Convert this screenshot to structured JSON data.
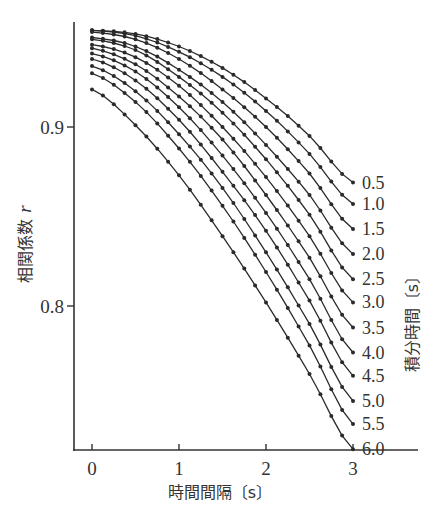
{
  "chart_data": {
    "type": "line",
    "title": "",
    "xlabel": "時間間隔〔s〕",
    "ylabel": "相関係数",
    "ylabel_symbol": "r",
    "legend_title": "積分時間〔s〕",
    "xlim": [
      -0.2,
      3.75
    ],
    "ylim": [
      0.72,
      0.959
    ],
    "x_ticks": [
      0,
      1,
      2,
      3
    ],
    "x_tick_labels": [
      "0",
      "1",
      "2",
      "3"
    ],
    "y_ticks": [
      0.8,
      0.9
    ],
    "y_tick_labels": [
      "0.8",
      "0.9"
    ],
    "grid": false,
    "legend_position": "right, labels at line ends",
    "markers": "small filled dots",
    "x": [
      0,
      0.5,
      1.0,
      1.5,
      2.0,
      2.5,
      3.0
    ],
    "series": [
      {
        "name": "0.5",
        "values": [
          0.954,
          0.952,
          0.945,
          0.933,
          0.916,
          0.895,
          0.869
        ]
      },
      {
        "name": "1.0",
        "values": [
          0.954,
          0.951,
          0.942,
          0.928,
          0.909,
          0.885,
          0.857
        ]
      },
      {
        "name": "1.5",
        "values": [
          0.953,
          0.949,
          0.938,
          0.921,
          0.9,
          0.874,
          0.843
        ]
      },
      {
        "name": "2.0",
        "values": [
          0.95,
          0.945,
          0.932,
          0.914,
          0.89,
          0.862,
          0.829
        ]
      },
      {
        "name": "2.5",
        "values": [
          0.949,
          0.943,
          0.928,
          0.908,
          0.882,
          0.851,
          0.815
        ]
      },
      {
        "name": "3.0",
        "values": [
          0.946,
          0.939,
          0.923,
          0.9,
          0.872,
          0.839,
          0.802
        ]
      },
      {
        "name": "3.5",
        "values": [
          0.944,
          0.935,
          0.917,
          0.893,
          0.862,
          0.827,
          0.788
        ]
      },
      {
        "name": "4.0",
        "values": [
          0.941,
          0.931,
          0.911,
          0.884,
          0.852,
          0.815,
          0.774
        ]
      },
      {
        "name": "4.5",
        "values": [
          0.938,
          0.926,
          0.904,
          0.875,
          0.842,
          0.803,
          0.761
        ]
      },
      {
        "name": "5.0",
        "values": [
          0.934,
          0.92,
          0.896,
          0.866,
          0.83,
          0.79,
          0.747
        ]
      },
      {
        "name": "5.5",
        "values": [
          0.93,
          0.914,
          0.888,
          0.856,
          0.819,
          0.778,
          0.734
        ]
      },
      {
        "name": "6.0",
        "values": [
          0.921,
          0.901,
          0.873,
          0.839,
          0.802,
          0.762,
          0.72
        ]
      }
    ]
  },
  "colors": {
    "line": "#2a2a2a",
    "axis": "#333333",
    "background": "#ffffff"
  }
}
